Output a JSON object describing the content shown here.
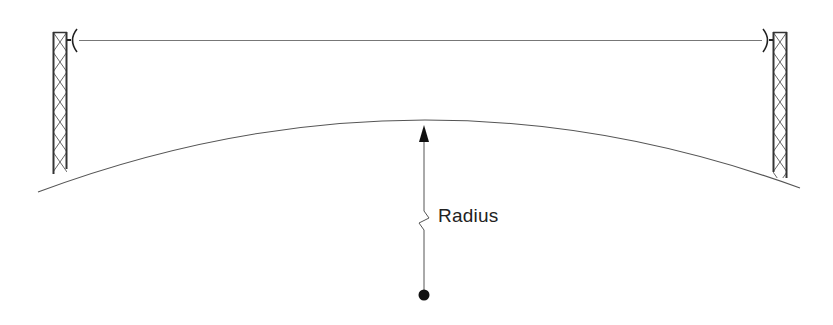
{
  "diagram": {
    "title": "",
    "labels": {
      "radius": "Radius"
    },
    "elements": [
      {
        "id": "left-tower",
        "type": "lattice-tower",
        "x": 53,
        "width": 14,
        "top": 32,
        "bottom": 172
      },
      {
        "id": "right-tower",
        "type": "lattice-tower",
        "x": 773,
        "width": 14,
        "top": 32,
        "bottom": 177
      },
      {
        "id": "left-antenna",
        "type": "dish-antenna",
        "facing": "right"
      },
      {
        "id": "right-antenna",
        "type": "dish-antenna",
        "facing": "left"
      },
      {
        "id": "line-of-sight",
        "type": "line",
        "from": "left-antenna",
        "to": "right-antenna"
      },
      {
        "id": "earth-curve",
        "type": "arc",
        "description": "curvature of the earth"
      },
      {
        "id": "radius-arrow",
        "type": "arrow",
        "from": "earth-center",
        "to": "earth-surface",
        "broken": true
      },
      {
        "id": "earth-center",
        "type": "point"
      }
    ],
    "colors": {
      "stroke": "#333333",
      "thin_line": "#666666",
      "background": "#ffffff"
    }
  }
}
